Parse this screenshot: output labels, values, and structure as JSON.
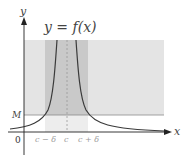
{
  "diagram": {
    "function_label": "y = f(x)",
    "axes": {
      "x_label": "x",
      "y_label": "y",
      "origin_label": "0"
    },
    "level_label": "M",
    "x_ticks": [
      "c − δ",
      "c",
      "c + δ"
    ],
    "colors": {
      "outer_region": "#e4e4e4",
      "inner_band": "#c9c9c9",
      "lower_band": "#ededed",
      "curve": "#3a3a3a",
      "axis": "#222222",
      "m_line": "#8a8a8a",
      "dashed_line": "#999999"
    }
  }
}
